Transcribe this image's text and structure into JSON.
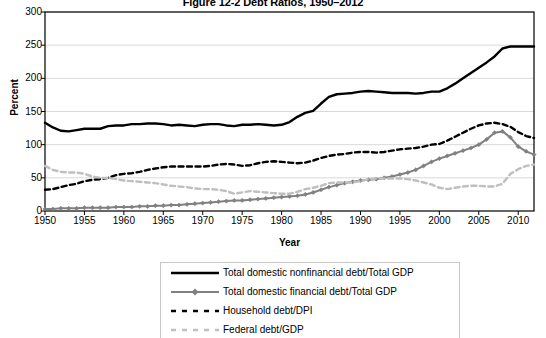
{
  "chart_data": {
    "type": "line",
    "title": "Figure 12-2 Debt Ratios, 1950–2012",
    "xlabel": "Year",
    "ylabel": "Percent",
    "ylim": [
      0,
      300
    ],
    "xlim": [
      1950,
      2012
    ],
    "yticks": [
      0,
      50,
      100,
      150,
      200,
      250,
      300
    ],
    "xticks": [
      1950,
      1955,
      1960,
      1965,
      1970,
      1975,
      1980,
      1985,
      1990,
      1995,
      2000,
      2005,
      2010
    ],
    "grid": "horizontal",
    "legend_position": "bottom",
    "x": [
      1950,
      1951,
      1952,
      1953,
      1954,
      1955,
      1956,
      1957,
      1958,
      1959,
      1960,
      1961,
      1962,
      1963,
      1964,
      1965,
      1966,
      1967,
      1968,
      1969,
      1970,
      1971,
      1972,
      1973,
      1974,
      1975,
      1976,
      1977,
      1978,
      1979,
      1980,
      1981,
      1982,
      1983,
      1984,
      1985,
      1986,
      1987,
      1988,
      1989,
      1990,
      1991,
      1992,
      1993,
      1994,
      1995,
      1996,
      1997,
      1998,
      1999,
      2000,
      2001,
      2002,
      2003,
      2004,
      2005,
      2006,
      2007,
      2008,
      2009,
      2010,
      2011,
      2012
    ],
    "series": [
      {
        "name": "Total domestic nonfinancial debt/Total GDP",
        "color": "#000000",
        "style": "solid",
        "width": 2.4,
        "marker": "none",
        "values": [
          133,
          126,
          121,
          120,
          122,
          124,
          124,
          124,
          128,
          129,
          129,
          131,
          131,
          132,
          132,
          131,
          129,
          130,
          129,
          128,
          130,
          131,
          131,
          129,
          128,
          130,
          130,
          131,
          130,
          129,
          130,
          134,
          142,
          148,
          151,
          162,
          172,
          176,
          177,
          178,
          180,
          181,
          180,
          179,
          178,
          178,
          178,
          177,
          178,
          180,
          180,
          185,
          192,
          200,
          208,
          216,
          224,
          233,
          245,
          248,
          248,
          248,
          248
        ]
      },
      {
        "name": "Total domestic financial debt/Total GDP",
        "color": "#808080",
        "style": "solid",
        "width": 2.0,
        "marker": "diamond",
        "values": [
          3,
          3,
          4,
          4,
          4,
          5,
          5,
          5,
          5,
          6,
          6,
          6,
          7,
          7,
          8,
          8,
          9,
          9,
          10,
          11,
          12,
          13,
          14,
          15,
          16,
          16,
          17,
          18,
          19,
          20,
          21,
          22,
          23,
          25,
          28,
          32,
          36,
          39,
          42,
          44,
          46,
          47,
          48,
          50,
          52,
          55,
          58,
          62,
          68,
          74,
          79,
          83,
          87,
          91,
          95,
          100,
          108,
          118,
          120,
          111,
          97,
          90,
          85
        ]
      },
      {
        "name": "Household debt/DPI",
        "color": "#000000",
        "style": "dashed",
        "width": 2.4,
        "marker": "none",
        "values": [
          32,
          33,
          36,
          39,
          41,
          45,
          47,
          48,
          50,
          54,
          56,
          57,
          59,
          62,
          64,
          66,
          67,
          67,
          67,
          67,
          67,
          68,
          70,
          71,
          70,
          68,
          69,
          72,
          74,
          75,
          74,
          73,
          72,
          73,
          76,
          80,
          83,
          85,
          86,
          88,
          89,
          89,
          88,
          89,
          91,
          93,
          94,
          95,
          97,
          100,
          101,
          106,
          112,
          118,
          124,
          129,
          132,
          133,
          131,
          127,
          119,
          113,
          110
        ]
      },
      {
        "name": "Federal debt/GDP",
        "color": "#bfbfbf",
        "style": "dashed",
        "width": 2.4,
        "marker": "none",
        "values": [
          68,
          62,
          59,
          58,
          58,
          56,
          52,
          50,
          50,
          48,
          46,
          45,
          44,
          43,
          42,
          40,
          38,
          37,
          36,
          34,
          33,
          33,
          32,
          30,
          26,
          28,
          30,
          29,
          28,
          27,
          26,
          26,
          29,
          33,
          35,
          38,
          42,
          43,
          43,
          43,
          45,
          48,
          49,
          49,
          49,
          49,
          48,
          46,
          43,
          40,
          35,
          33,
          35,
          37,
          38,
          38,
          37,
          37,
          41,
          56,
          63,
          68,
          70
        ]
      }
    ]
  },
  "legend": {
    "items": [
      {
        "label": "Total domestic nonfinancial debt/Total GDP"
      },
      {
        "label": "Total domestic financial debt/Total GDP"
      },
      {
        "label": "Household debt/DPI"
      },
      {
        "label": "Federal debt/GDP"
      }
    ]
  }
}
